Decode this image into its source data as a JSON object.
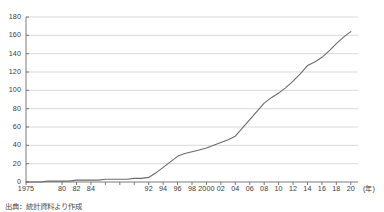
{
  "chart_data": {
    "type": "line",
    "title": "",
    "subtitle": "",
    "xlabel": "",
    "ylabel": "",
    "x_unit_label": "(年)",
    "xlim": [
      1975,
      2021
    ],
    "ylim": [
      0,
      180
    ],
    "y_ticks": [
      0,
      20,
      40,
      60,
      80,
      100,
      120,
      140,
      160,
      180
    ],
    "x_tick_labels": [
      "1975",
      "80",
      "82",
      "84",
      "92",
      "94",
      "96",
      "98",
      "2000",
      "02",
      "04",
      "06",
      "08",
      "10",
      "12",
      "14",
      "16",
      "18",
      "20"
    ],
    "x_tick_years": [
      1975,
      1980,
      1982,
      1984,
      1986,
      1988,
      1990,
      1992,
      1994,
      1996,
      1998,
      2000,
      2002,
      2004,
      2006,
      2008,
      2010,
      2012,
      2014,
      2016,
      2018,
      2020
    ],
    "grid": true,
    "grid_axis": "y",
    "legend": false,
    "legend_position": "none",
    "line_color": "#6b6b6b",
    "grid_color": "#c9c9c9",
    "axis_color": "#6b6b6b",
    "series": [
      {
        "name": "累計",
        "x": [
          1975,
          1976,
          1977,
          1978,
          1979,
          1980,
          1981,
          1982,
          1983,
          1984,
          1985,
          1986,
          1987,
          1988,
          1989,
          1990,
          1991,
          1992,
          1993,
          1994,
          1995,
          1996,
          1997,
          1998,
          1999,
          2000,
          2001,
          2002,
          2003,
          2004,
          2005,
          2006,
          2007,
          2008,
          2009,
          2010,
          2011,
          2012,
          2013,
          2014,
          2015,
          2016,
          2017,
          2018,
          2019,
          2020
        ],
        "values": [
          0,
          0,
          0,
          1,
          1,
          1,
          1,
          2,
          2,
          2,
          2,
          3,
          3,
          3,
          3,
          4,
          4,
          5,
          10,
          16,
          22,
          28,
          31,
          33,
          35,
          37,
          40,
          43,
          46,
          50,
          59,
          68,
          77,
          86,
          92,
          97,
          103,
          110,
          118,
          127,
          131,
          136,
          143,
          151,
          158,
          164
        ]
      }
    ]
  },
  "caption": {
    "text": "出典：統計資料より作成"
  }
}
